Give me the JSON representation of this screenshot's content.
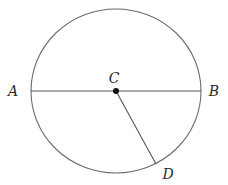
{
  "diagram": {
    "type": "geometry",
    "circle": {
      "cx": 116,
      "cy": 91,
      "rx": 85,
      "ry": 82,
      "stroke": "#6b6b6b"
    },
    "points": {
      "A": {
        "label": "A",
        "x": 31,
        "y": 91,
        "label_x": 13,
        "label_y": 91
      },
      "B": {
        "label": "B",
        "x": 201,
        "y": 91,
        "label_x": 214,
        "label_y": 91
      },
      "C": {
        "label": "C",
        "x": 116,
        "y": 91,
        "label_x": 114,
        "label_y": 78
      },
      "D": {
        "label": "D",
        "x": 156,
        "y": 164,
        "label_x": 168,
        "label_y": 174
      }
    },
    "segments": [
      {
        "from": "A",
        "to": "B",
        "name": "diameter-AB"
      },
      {
        "from": "C",
        "to": "D",
        "name": "radius-CD"
      }
    ],
    "center_dot": {
      "radius": 3,
      "fill": "#111111"
    },
    "line_color": "#555555"
  }
}
